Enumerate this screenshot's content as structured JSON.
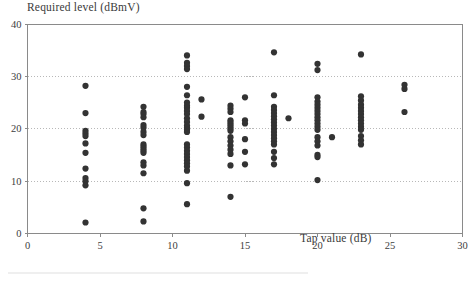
{
  "chart_data": {
    "type": "scatter",
    "title": "",
    "ylabel": "Required level (dBmV)",
    "xlabel": "Tap value (dB)",
    "xlim": [
      0,
      30
    ],
    "ylim": [
      0,
      40
    ],
    "xticks": [
      0,
      5,
      10,
      15,
      20,
      25,
      30
    ],
    "xtick_labels": [
      "0",
      "5",
      "10",
      "15",
      "20",
      "25",
      "30"
    ],
    "yticks": [
      0,
      10,
      20,
      30,
      40
    ],
    "ytick_labels": [
      "0",
      "10",
      "20",
      "30",
      "40"
    ],
    "grid": "horizontal-dotted",
    "legend": "none",
    "marker": "filled-circle",
    "marker_color": "#333333",
    "marker_size": 3.1,
    "points": [
      [
        4,
        28.2
      ],
      [
        4,
        23.0
      ],
      [
        4,
        19.6
      ],
      [
        4,
        19.1
      ],
      [
        4,
        18.6
      ],
      [
        4,
        17.2
      ],
      [
        4,
        15.4
      ],
      [
        4,
        12.4
      ],
      [
        4,
        10.6
      ],
      [
        4,
        10.0
      ],
      [
        4,
        9.2
      ],
      [
        4,
        2.1
      ],
      [
        8,
        24.2
      ],
      [
        8,
        23.2
      ],
      [
        8,
        22.8
      ],
      [
        8,
        22.2
      ],
      [
        8,
        20.7
      ],
      [
        8,
        20.2
      ],
      [
        8,
        19.4
      ],
      [
        8,
        18.8
      ],
      [
        8,
        17.0
      ],
      [
        8,
        16.6
      ],
      [
        8,
        16.2
      ],
      [
        8,
        15.8
      ],
      [
        8,
        15.4
      ],
      [
        8,
        13.6
      ],
      [
        8,
        13.0
      ],
      [
        8,
        11.5
      ],
      [
        8,
        4.8
      ],
      [
        8,
        2.3
      ],
      [
        11,
        34.0
      ],
      [
        11,
        32.6
      ],
      [
        11,
        32.0
      ],
      [
        11,
        31.4
      ],
      [
        11,
        28.0
      ],
      [
        11,
        26.4
      ],
      [
        11,
        25.0
      ],
      [
        11,
        24.4
      ],
      [
        11,
        24.0
      ],
      [
        11,
        23.4
      ],
      [
        11,
        22.8
      ],
      [
        11,
        22.0
      ],
      [
        11,
        21.3
      ],
      [
        11,
        20.6
      ],
      [
        11,
        20.2
      ],
      [
        11,
        19.8
      ],
      [
        11,
        19.4
      ],
      [
        11,
        17.0
      ],
      [
        11,
        16.4
      ],
      [
        11,
        15.8
      ],
      [
        11,
        15.2
      ],
      [
        11,
        14.6
      ],
      [
        11,
        14.0
      ],
      [
        11,
        13.4
      ],
      [
        11,
        12.8
      ],
      [
        11,
        12.0
      ],
      [
        11,
        9.6
      ],
      [
        11,
        5.6
      ],
      [
        12,
        25.6
      ],
      [
        12,
        22.3
      ],
      [
        14,
        24.4
      ],
      [
        14,
        23.8
      ],
      [
        14,
        23.2
      ],
      [
        14,
        21.6
      ],
      [
        14,
        21.2
      ],
      [
        14,
        20.8
      ],
      [
        14,
        20.4
      ],
      [
        14,
        20.0
      ],
      [
        14,
        19.6
      ],
      [
        14,
        18.4
      ],
      [
        14,
        17.6
      ],
      [
        14,
        16.8
      ],
      [
        14,
        16.0
      ],
      [
        14,
        15.2
      ],
      [
        14,
        13.0
      ],
      [
        14,
        7.0
      ],
      [
        15,
        26.0
      ],
      [
        15,
        21.6
      ],
      [
        15,
        21.0
      ],
      [
        15,
        18.0
      ],
      [
        15,
        15.6
      ],
      [
        15,
        13.2
      ],
      [
        17,
        34.6
      ],
      [
        17,
        26.4
      ],
      [
        17,
        24.2
      ],
      [
        17,
        23.6
      ],
      [
        17,
        23.0
      ],
      [
        17,
        22.4
      ],
      [
        17,
        21.8
      ],
      [
        17,
        21.2
      ],
      [
        17,
        20.6
      ],
      [
        17,
        20.0
      ],
      [
        17,
        19.4
      ],
      [
        17,
        18.8
      ],
      [
        17,
        18.2
      ],
      [
        17,
        17.6
      ],
      [
        17,
        17.0
      ],
      [
        17,
        15.6
      ],
      [
        17,
        14.4
      ],
      [
        17,
        13.2
      ],
      [
        18,
        22.0
      ],
      [
        20,
        32.4
      ],
      [
        20,
        31.2
      ],
      [
        20,
        26.0
      ],
      [
        20,
        25.2
      ],
      [
        20,
        24.6
      ],
      [
        20,
        24.0
      ],
      [
        20,
        23.4
      ],
      [
        20,
        22.8
      ],
      [
        20,
        22.2
      ],
      [
        20,
        21.6
      ],
      [
        20,
        21.0
      ],
      [
        20,
        20.4
      ],
      [
        20,
        19.8
      ],
      [
        20,
        18.4
      ],
      [
        20,
        17.6
      ],
      [
        20,
        16.8
      ],
      [
        20,
        15.0
      ],
      [
        20,
        14.6
      ],
      [
        20,
        10.2
      ],
      [
        21,
        18.4
      ],
      [
        23,
        34.2
      ],
      [
        23,
        26.2
      ],
      [
        23,
        25.4
      ],
      [
        23,
        24.6
      ],
      [
        23,
        24.0
      ],
      [
        23,
        23.4
      ],
      [
        23,
        22.8
      ],
      [
        23,
        22.2
      ],
      [
        23,
        21.6
      ],
      [
        23,
        21.0
      ],
      [
        23,
        20.4
      ],
      [
        23,
        19.8
      ],
      [
        23,
        18.6
      ],
      [
        23,
        17.8
      ],
      [
        23,
        17.0
      ],
      [
        26,
        28.4
      ],
      [
        26,
        27.6
      ],
      [
        26,
        23.2
      ]
    ]
  }
}
